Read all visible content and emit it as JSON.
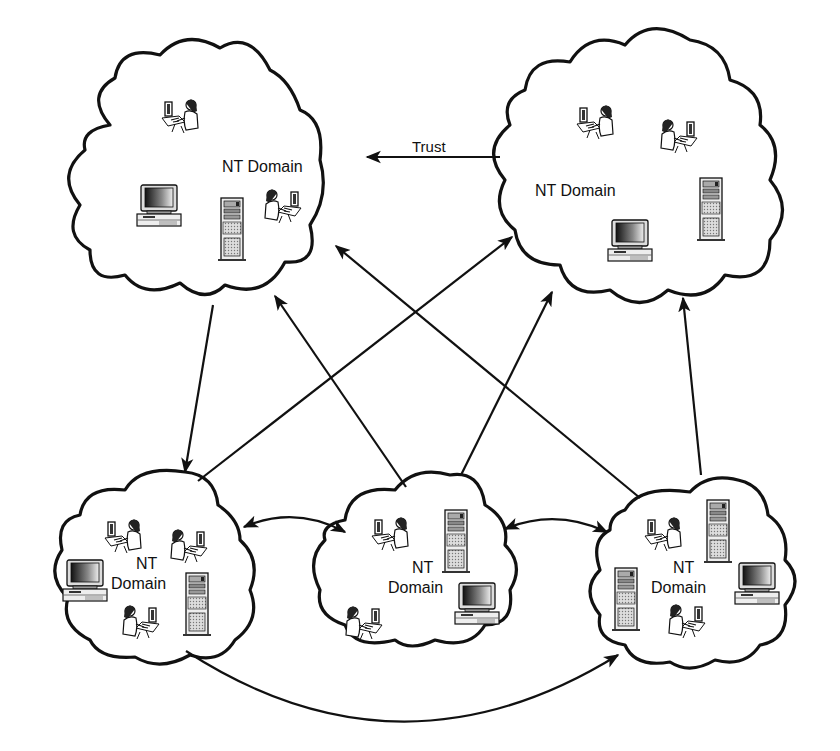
{
  "diagram": {
    "type": "network-trust-diagram",
    "colors": {
      "stroke": "#111111",
      "background": "#ffffff"
    },
    "domains": [
      {
        "id": "top-left",
        "label_line1": "NT Domain",
        "label_line2": "",
        "devices": [
          "user-workstation",
          "desktop-computer",
          "server-tower",
          "user-workstation"
        ]
      },
      {
        "id": "top-right",
        "label_line1": "NT Domain",
        "label_line2": "",
        "devices": [
          "user-workstation",
          "user-workstation",
          "server-tower",
          "desktop-computer"
        ]
      },
      {
        "id": "bottom-left",
        "label_line1": "NT",
        "label_line2": "Domain",
        "devices": [
          "user-workstation",
          "user-workstation",
          "desktop-computer",
          "server-tower",
          "user-workstation"
        ]
      },
      {
        "id": "bottom-middle",
        "label_line1": "NT",
        "label_line2": "Domain",
        "devices": [
          "user-workstation",
          "server-tower",
          "desktop-computer",
          "user-workstation"
        ]
      },
      {
        "id": "bottom-right",
        "label_line1": "NT",
        "label_line2": "Domain",
        "devices": [
          "user-workstation",
          "server-tower",
          "server-tower",
          "desktop-computer",
          "user-workstation"
        ]
      }
    ],
    "trust_label": "Trust",
    "relationships": [
      {
        "from": "top-right",
        "to": "top-left",
        "label": "Trust"
      },
      {
        "from": "top-left",
        "to": "bottom-left"
      },
      {
        "from": "bottom-left",
        "to": "top-right"
      },
      {
        "from": "bottom-middle",
        "to": "top-left"
      },
      {
        "from": "bottom-middle",
        "to": "top-right"
      },
      {
        "from": "bottom-right",
        "to": "top-left"
      },
      {
        "from": "bottom-right",
        "to": "top-right"
      },
      {
        "from": "bottom-left",
        "to": "bottom-middle",
        "bidirectional": true
      },
      {
        "from": "bottom-middle",
        "to": "bottom-right",
        "bidirectional": true
      },
      {
        "from": "bottom-left",
        "to": "bottom-right"
      }
    ]
  }
}
